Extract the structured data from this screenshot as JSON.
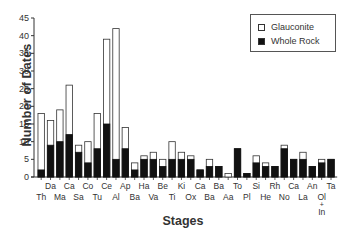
{
  "chart_data": {
    "type": "bar",
    "stacked": true,
    "title": "",
    "xlabel": "Stages",
    "ylabel": "Number of Dates",
    "ylim": [
      0,
      45
    ],
    "yticks": [
      0,
      5,
      10,
      15,
      20,
      25,
      30,
      35,
      40,
      45
    ],
    "grid": false,
    "legend_position": "top-right",
    "categories": [
      "Th",
      "Da",
      "Ma",
      "Ca",
      "Sa",
      "Co",
      "Tu",
      "Ce",
      "Al",
      "Ap",
      "Ba",
      "Ha",
      "Va",
      "Be",
      "Ti",
      "Ki",
      "Ox",
      "Ca",
      "Ba",
      "Ba",
      "Aa",
      "To",
      "Pl",
      "Si",
      "He",
      "Rh",
      "No",
      "Ca",
      "La",
      "An",
      "Ol + In",
      "Ta"
    ],
    "label_rows": {
      "top": [
        "Da",
        "Ca",
        "Co",
        "Ce",
        "Ap",
        "Ha",
        "Be",
        "Ki",
        "Ca",
        "Ba",
        "To",
        "Si",
        "Rh",
        "Ca",
        "An",
        "Ta"
      ],
      "bottom": [
        "Th",
        "Ma",
        "Sa",
        "Tu",
        "Al",
        "Ba",
        "Va",
        "Ti",
        "Ox",
        "Ba",
        "Aa",
        "Pl",
        "He",
        "No",
        "La",
        "Ol + In"
      ]
    },
    "series": [
      {
        "name": "Whole Rock",
        "color": "#111111",
        "values": [
          2,
          9,
          10,
          12,
          7,
          4,
          8,
          15,
          5,
          8,
          2,
          5,
          5,
          3,
          5,
          5,
          5,
          2,
          3,
          3,
          0,
          8,
          1,
          4,
          3,
          3,
          8,
          5,
          5,
          3,
          4,
          5
        ]
      },
      {
        "name": "Glauconite",
        "color": "#ffffff",
        "values": [
          16,
          7,
          9,
          14,
          2,
          6,
          10,
          24,
          37,
          6,
          2,
          1,
          2,
          2,
          5,
          2,
          1,
          0,
          2,
          0,
          1,
          0,
          0,
          2,
          1,
          0,
          1,
          0,
          2,
          0,
          1,
          0
        ]
      }
    ],
    "totals": [
      18,
      16,
      19,
      26,
      9,
      10,
      18,
      39,
      42,
      14,
      4,
      6,
      7,
      5,
      10,
      7,
      6,
      2,
      5,
      3,
      1,
      8,
      1,
      6,
      4,
      3,
      9,
      5,
      7,
      3,
      5,
      5
    ]
  },
  "legend": {
    "items": [
      {
        "label": "Glauconite",
        "swatch": "#ffffff"
      },
      {
        "label": "Whole Rock",
        "swatch": "#111111"
      }
    ]
  },
  "axes": {
    "x_title": "Stages",
    "y_title": "Number of Dates"
  }
}
